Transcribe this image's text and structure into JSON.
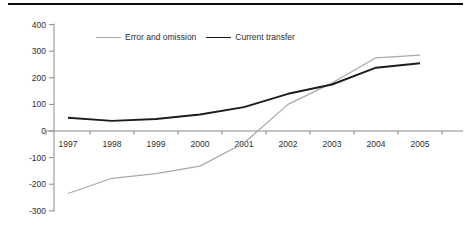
{
  "chart_data": {
    "type": "line",
    "title": "",
    "xlabel": "",
    "ylabel": "",
    "categories": [
      "1997",
      "1998",
      "1999",
      "2000",
      "2001",
      "2002",
      "2003",
      "2004",
      "2005"
    ],
    "series": [
      {
        "name": "Error and omission",
        "color": "#a8a8a8",
        "values": [
          -235,
          -178,
          -160,
          -132,
          -45,
          100,
          180,
          275,
          285
        ]
      },
      {
        "name": "Current transfer",
        "color": "#1c1c1c",
        "values": [
          50,
          38,
          45,
          62,
          90,
          140,
          175,
          238,
          255
        ]
      }
    ],
    "y_axis": {
      "min": -300,
      "max": 400,
      "tick_step": 100,
      "tick_labels": [
        "400",
        "300",
        "200",
        "100",
        "0",
        "-100",
        "-200",
        "-300"
      ]
    },
    "legend_position": "top-center",
    "grid": false,
    "axis_color": "#8c8c8c",
    "text_color": "#2e2e2e"
  }
}
